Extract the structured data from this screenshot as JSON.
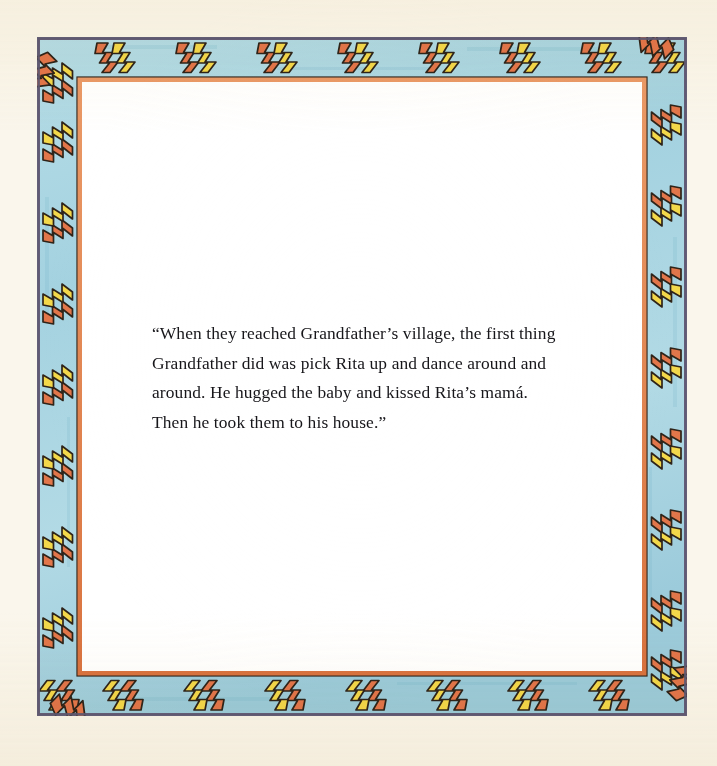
{
  "page": {
    "kind": "picture-book-page",
    "paper_color": "#faf6ec",
    "field_color": "#ffffff",
    "width": 717,
    "height": 766
  },
  "frame": {
    "name": "southwestern-zigzag-border",
    "outer_line_color": "#6f6a84",
    "band_color": "#a9d6e2",
    "inner_line_color": "#e08e5e",
    "motif_outline_color": "#2a2119",
    "motif_orange_color": "#e2764a",
    "motif_yellow_color": "#f3d84a",
    "top_motif_count": 8,
    "bottom_motif_count": 8,
    "left_motif_count": 8,
    "right_motif_count": 8
  },
  "text": {
    "paragraph": "“When they reached Grandfather’s village, the first thing Grandfather did was pick Rita up and dance around and around. He hugged the baby and kissed Rita’s mamá. Then he took them to his house.”",
    "lines": [
      "“When they reached Grandfather’s village, the first thing",
      "Grandfather did was pick Rita up and dance around and",
      "around. He hugged the baby and kissed Rita’s mamá.",
      "Then he took them to his house.”"
    ],
    "color": "#17161a"
  }
}
